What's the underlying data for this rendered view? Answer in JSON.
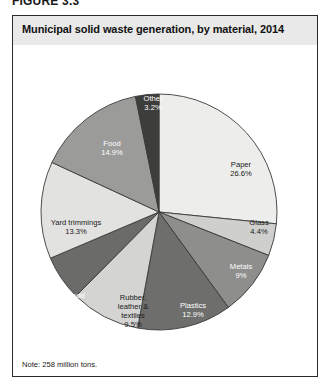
{
  "figure": {
    "number_label": "FIGURE 3.3",
    "title": "Municipal solid waste generation, by material, 2014",
    "note": "Note: 258 million tons."
  },
  "chart_data": {
    "type": "pie",
    "title": "Municipal solid waste generation, by material, 2014",
    "note": "Note: 258 million tons.",
    "total_label": "258 million tons",
    "unit": "percent",
    "legend": "none (labels drawn on slices)",
    "start_angle_deg": 0,
    "direction": "clockwise",
    "categories": [
      "Paper",
      "Glass",
      "Metals",
      "Plastics",
      "Rubber, leather & textiles",
      "Wood",
      "Yard trimmings",
      "Food",
      "Other"
    ],
    "values": [
      26.6,
      4.4,
      9,
      12.9,
      9.5,
      6.2,
      13.3,
      14.9,
      3.2
    ],
    "slices": [
      {
        "name": "Paper",
        "label_lines": [
          "Paper",
          "26.6%"
        ],
        "value": 26.6,
        "value_text": "26.6%",
        "color": "#ededeb",
        "label_color": "dark",
        "label_x": 228,
        "label_y": 122
      },
      {
        "name": "Glass",
        "label_lines": [
          "Glass",
          "4.4%"
        ],
        "value": 4.4,
        "value_text": "4.4%",
        "color": "#cfcfcd",
        "label_color": "dark",
        "label_x": 246,
        "label_y": 180
      },
      {
        "name": "Metals",
        "label_lines": [
          "Metals",
          "9%"
        ],
        "value": 9,
        "value_text": "9%",
        "color": "#8e8e8c",
        "label_color": "light",
        "label_x": 228,
        "label_y": 224
      },
      {
        "name": "Plastics",
        "label_lines": [
          "Plastics",
          "12.9%"
        ],
        "value": 12.9,
        "value_text": "12.9%",
        "color": "#6e6e6c",
        "label_color": "light",
        "label_x": 180,
        "label_y": 263
      },
      {
        "name": "Rubber, leather & textiles",
        "label_lines": [
          "Rubber,",
          "leather &",
          "textiles",
          "9.5%"
        ],
        "value": 9.5,
        "value_text": "9.5%",
        "color": "#d4d4d2",
        "label_color": "dark",
        "label_x": 120,
        "label_y": 255
      },
      {
        "name": "Wood",
        "label_lines": [
          "Wood",
          "6.2%"
        ],
        "value": 6.2,
        "value_text": "6.2%",
        "color": "#6b6b69",
        "label_color": "light",
        "label_x": 62,
        "label_y": 253
      },
      {
        "name": "Yard trimmings",
        "label_lines": [
          "Yard trimmings",
          "13.3%"
        ],
        "value": 13.3,
        "value_text": "13.3%",
        "color": "#e2e2e0",
        "label_color": "dark",
        "label_x": 63,
        "label_y": 180
      },
      {
        "name": "Food",
        "label_lines": [
          "Food",
          "14.9%"
        ],
        "value": 14.9,
        "value_text": "14.9%",
        "color": "#9b9b99",
        "label_color": "light",
        "label_x": 99,
        "label_y": 101
      },
      {
        "name": "Other",
        "label_lines": [
          "Other",
          "3.2%"
        ],
        "value": 3.2,
        "value_text": "3.2%",
        "color": "#3d3d3b",
        "label_color": "light",
        "label_x": 140,
        "label_y": 56
      }
    ],
    "geometry": {
      "cx": 146,
      "cy": 167,
      "r": 118,
      "stroke": "#3a3a38",
      "stroke_width": 0.9
    }
  },
  "colors": {
    "title_band": "#e9e9e9",
    "border": "#2b2b2b",
    "text": "#1a1a1a",
    "background": "#ffffff"
  }
}
